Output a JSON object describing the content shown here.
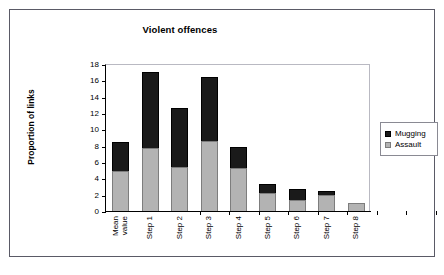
{
  "figure": {
    "caption_visible": false
  },
  "chart_data": {
    "type": "bar",
    "subtype": "stacked-vertical",
    "title": "Violent offences",
    "xlabel": "",
    "ylabel": "Proportion of links",
    "ylim": [
      0,
      18
    ],
    "yticks": [
      0,
      2,
      4,
      6,
      8,
      10,
      12,
      14,
      16,
      18
    ],
    "grid": false,
    "legend_position": "right",
    "categories": [
      "Mean value",
      "Step 1",
      "Step 2",
      "Step 3",
      "Step 4",
      "Step 5",
      "Step 6",
      "Step 7",
      "Step 8"
    ],
    "category_lines": [
      [
        "Mean",
        "value"
      ],
      [
        "Step 1"
      ],
      [
        "Step 2"
      ],
      [
        "Step 3"
      ],
      [
        "Step 4"
      ],
      [
        "Step 5"
      ],
      [
        "Step 6"
      ],
      [
        "Step 7"
      ],
      [
        "Step 8"
      ]
    ],
    "series": [
      {
        "name": "Assault",
        "color": "#b3b3b3",
        "values": [
          4.9,
          7.7,
          5.4,
          8.6,
          5.3,
          2.2,
          1.4,
          2.0,
          1.0
        ]
      },
      {
        "name": "Mugging",
        "color": "#1a1a1a",
        "values": [
          3.6,
          9.3,
          7.2,
          7.8,
          2.6,
          1.1,
          1.3,
          0.5,
          0.0
        ]
      }
    ],
    "totals": [
      8.5,
      17.0,
      12.6,
      16.4,
      7.9,
      3.3,
      2.7,
      2.5,
      1.0
    ]
  },
  "legend": {
    "items": [
      {
        "label": "Mugging",
        "color": "#1a1a1a"
      },
      {
        "label": "Assault",
        "color": "#b3b3b3"
      }
    ]
  }
}
